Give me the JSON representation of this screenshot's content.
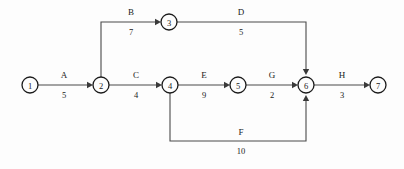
{
  "diagram": {
    "type": "activity-on-arrow-network-diagram",
    "title": "",
    "background_color": "#fdfdfd",
    "line_color": "#4a4a4a",
    "node_stroke_color": "#1a1a1a",
    "text_color": "#1a1a1a",
    "nodes": [
      {
        "id": "1",
        "label": "1",
        "cx": 30,
        "cy": 85,
        "r": 8
      },
      {
        "id": "2",
        "label": "2",
        "cx": 101,
        "cy": 85,
        "r": 8
      },
      {
        "id": "3",
        "label": "3",
        "cx": 169,
        "cy": 22,
        "r": 8
      },
      {
        "id": "4",
        "label": "4",
        "cx": 170,
        "cy": 85,
        "r": 8
      },
      {
        "id": "5",
        "label": "5",
        "cx": 238,
        "cy": 85,
        "r": 8
      },
      {
        "id": "6",
        "label": "6",
        "cx": 306,
        "cy": 85,
        "r": 8
      },
      {
        "id": "7",
        "label": "7",
        "cx": 378,
        "cy": 85,
        "r": 8
      }
    ],
    "edges": [
      {
        "id": "A",
        "name": "A",
        "weight": "5",
        "from": "1",
        "to": "2",
        "path": "M 38 85 L 91 85",
        "arrow": {
          "x": 93,
          "y": 85,
          "dir": "right"
        },
        "name_x": 64,
        "name_y": 78,
        "weight_x": 64,
        "weight_y": 98
      },
      {
        "id": "B",
        "name": "B",
        "weight": "7",
        "from": "2",
        "to": "3",
        "path": "M 101 77 L 101 22 L 159 22",
        "arrow": {
          "x": 161,
          "y": 22,
          "dir": "right"
        },
        "name_x": 131,
        "name_y": 15,
        "weight_x": 131,
        "weight_y": 35
      },
      {
        "id": "C",
        "name": "C",
        "weight": "4",
        "from": "2",
        "to": "4",
        "path": "M 109 85 L 160 85",
        "arrow": {
          "x": 162,
          "y": 85,
          "dir": "right"
        },
        "name_x": 136,
        "name_y": 78,
        "weight_x": 136,
        "weight_y": 98
      },
      {
        "id": "D",
        "name": "D",
        "weight": "5",
        "from": "3",
        "to": "6",
        "path": "M 177 22 L 306 22 L 306 73",
        "arrow": {
          "x": 306,
          "y": 75,
          "dir": "down"
        },
        "name_x": 241,
        "name_y": 15,
        "weight_x": 241,
        "weight_y": 35
      },
      {
        "id": "E",
        "name": "E",
        "weight": "9",
        "from": "4",
        "to": "5",
        "path": "M 178 85 L 228 85",
        "arrow": {
          "x": 230,
          "y": 85,
          "dir": "right"
        },
        "name_x": 204,
        "name_y": 78,
        "weight_x": 204,
        "weight_y": 98
      },
      {
        "id": "F",
        "name": "F",
        "weight": "10",
        "from": "4",
        "to": "6",
        "path": "M 170 93 L 170 141 L 306 141 L 306 97",
        "arrow": {
          "x": 306,
          "y": 95,
          "dir": "up"
        },
        "name_x": 241,
        "name_y": 135,
        "weight_x": 241,
        "weight_y": 154
      },
      {
        "id": "G",
        "name": "G",
        "weight": "2",
        "from": "5",
        "to": "6",
        "path": "M 246 85 L 296 85",
        "arrow": {
          "x": 298,
          "y": 85,
          "dir": "right"
        },
        "name_x": 272,
        "name_y": 78,
        "weight_x": 272,
        "weight_y": 98
      },
      {
        "id": "H",
        "name": "H",
        "weight": "3",
        "from": "6",
        "to": "7",
        "path": "M 314 85 L 368 85",
        "arrow": {
          "x": 370,
          "y": 85,
          "dir": "right"
        },
        "name_x": 342,
        "name_y": 78,
        "weight_x": 342,
        "weight_y": 98
      }
    ]
  }
}
